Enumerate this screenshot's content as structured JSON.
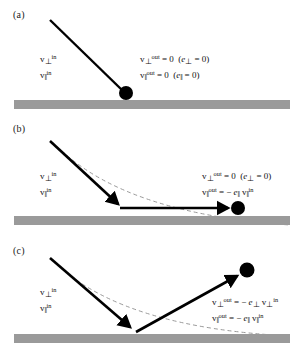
{
  "figure": {
    "ground_color": "#9a9a9a",
    "trajectory_color": "#000000",
    "dashed_curve_color": "#9a9a9a",
    "ball_color": "#000000"
  },
  "panels": [
    {
      "id": "a",
      "label": "(a)",
      "incoming_labels": {
        "perp": {
          "base": "v",
          "sub": "⊥",
          "sup": "in"
        },
        "par": {
          "base": "v",
          "sub": "‖",
          "sup": "in"
        }
      },
      "equations": [
        {
          "lhs_base": "v",
          "lhs_sub": "⊥",
          "lhs_sup": "out",
          "rhs": "= 0",
          "paren": "(e⊥ = 0)"
        },
        {
          "lhs_base": "v",
          "lhs_sub": "‖",
          "lhs_sup": "out",
          "rhs": "= 0",
          "paren": "(e‖ = 0)"
        }
      ],
      "outcome": "particle sticks: both velocity components zero"
    },
    {
      "id": "b",
      "label": "(b)",
      "incoming_labels": {
        "perp": {
          "base": "v",
          "sub": "⊥",
          "sup": "in"
        },
        "par": {
          "base": "v",
          "sub": "‖",
          "sup": "in"
        }
      },
      "equations": [
        {
          "lhs_base": "v",
          "lhs_sub": "⊥",
          "lhs_sup": "out",
          "rhs": "= 0",
          "paren": "(e⊥ = 0)"
        },
        {
          "lhs_base": "v",
          "lhs_sub": "‖",
          "lhs_sup": "out",
          "rhs": "= − e‖ v‖ in",
          "paren": ""
        }
      ],
      "outcome": "particle slides along surface"
    },
    {
      "id": "c",
      "label": "(c)",
      "incoming_labels": {
        "perp": {
          "base": "v",
          "sub": "⊥",
          "sup": "in"
        },
        "par": {
          "base": "v",
          "sub": "‖",
          "sup": "in"
        }
      },
      "equations": [
        {
          "lhs_base": "v",
          "lhs_sub": "⊥",
          "lhs_sup": "out",
          "rhs": "= − e⊥ v⊥ in",
          "paren": ""
        },
        {
          "lhs_base": "v",
          "lhs_sub": "‖",
          "lhs_sup": "out",
          "rhs": "= − e‖ v‖ in",
          "paren": ""
        }
      ],
      "outcome": "particle rebounds with both components reversed"
    }
  ],
  "symbols": {
    "v": "v",
    "e": "e",
    "perp": "⊥",
    "parallel": "‖",
    "in": "in",
    "out": "out",
    "zero": "0",
    "equals": "=",
    "minus": "−",
    "paren_open": "(",
    "paren_close": ")"
  }
}
